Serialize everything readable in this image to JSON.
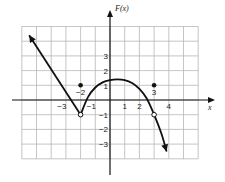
{
  "chart_data": {
    "type": "line",
    "title": "",
    "xlabel": "x",
    "ylabel": "F(x)",
    "xlim": [
      -6,
      6
    ],
    "ylim": [
      -4,
      5
    ],
    "grid": true,
    "x_ticks": [
      {
        "value": -3,
        "label": "−3"
      },
      {
        "value": -1,
        "label": "−1"
      },
      {
        "value": 1,
        "label": "1"
      },
      {
        "value": 2,
        "label": "2"
      },
      {
        "value": 4,
        "label": "4"
      }
    ],
    "y_ticks": [
      {
        "value": 3,
        "label": "3"
      },
      {
        "value": 2,
        "label": "2"
      },
      {
        "value": 1,
        "label": "1"
      },
      {
        "value": -1,
        "label": "−1"
      },
      {
        "value": -2,
        "label": "−2"
      },
      {
        "value": -3,
        "label": "−3"
      }
    ],
    "point_labels": [
      {
        "x": -2,
        "y": 1,
        "label": "−2"
      },
      {
        "x": 3,
        "y": 1,
        "label": "3"
      }
    ],
    "series": [
      {
        "name": "left ray",
        "kind": "line-with-arrow",
        "points": [
          [
            -2,
            -1
          ],
          [
            -5.5,
            4.4
          ]
        ]
      },
      {
        "name": "middle curve",
        "kind": "curve",
        "points": [
          [
            -2,
            -1
          ],
          [
            -1.5,
            0.2
          ],
          [
            -1,
            0.85
          ],
          [
            -0.5,
            1.2
          ],
          [
            0,
            1.35
          ],
          [
            0.5,
            1.4
          ],
          [
            1,
            1.35
          ],
          [
            1.5,
            1.15
          ],
          [
            2,
            0.75
          ],
          [
            2.5,
            0.1
          ],
          [
            3,
            -1
          ],
          [
            3.5,
            -2.3
          ],
          [
            3.85,
            -3.5
          ]
        ]
      }
    ],
    "open_points": [
      [
        -2,
        -1
      ],
      [
        3,
        -1
      ]
    ],
    "closed_points": [
      [
        -2,
        1
      ],
      [
        3,
        1
      ]
    ]
  }
}
